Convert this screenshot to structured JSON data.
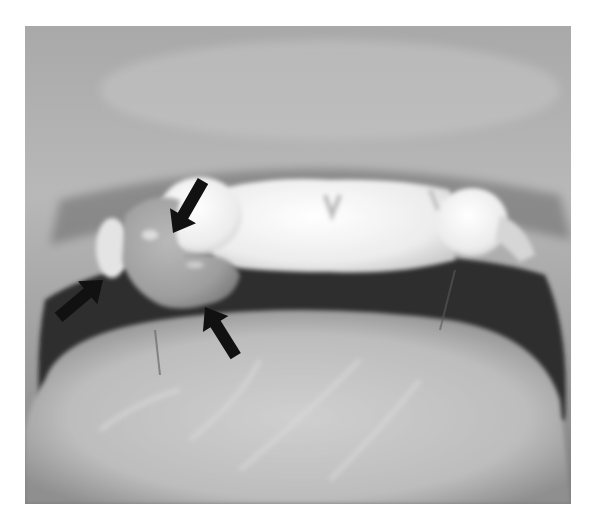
{
  "figure": {
    "type": "clinical-photograph",
    "color_mode": "grayscale",
    "annotations": [
      {
        "id": "arrow-top",
        "direction": "down-left",
        "tail": [
          205,
          178
        ],
        "tip": [
          173,
          233
        ],
        "color": "#111111"
      },
      {
        "id": "arrow-left",
        "direction": "up-right",
        "tail": [
          58,
          318
        ],
        "tip": [
          103,
          280
        ],
        "color": "#111111"
      },
      {
        "id": "arrow-bottom",
        "direction": "up-left",
        "tail": [
          237,
          357
        ],
        "tip": [
          205,
          307
        ],
        "color": "#111111"
      }
    ],
    "tones": {
      "background": "#ffffff",
      "lip": "#9a9a9a",
      "lip_highlight": "#bdbdbd",
      "teeth": "#f2f2f2",
      "lesion": "#a8a8a8",
      "oral_cavity": "#2e2e2e",
      "tongue": "#c4c4c4"
    }
  }
}
